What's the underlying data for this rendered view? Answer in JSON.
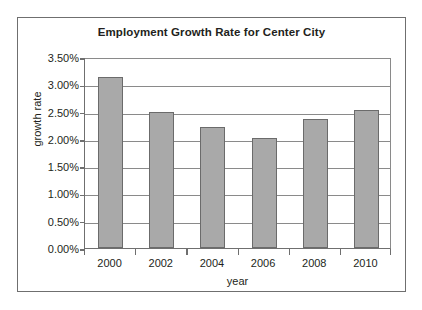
{
  "chart_data": {
    "type": "bar",
    "title": "Employment Growth Rate for Center City",
    "xlabel": "year",
    "ylabel": "growth rate",
    "categories": [
      "2000",
      "2002",
      "2004",
      "2006",
      "2008",
      "2010"
    ],
    "values": [
      3.13,
      2.5,
      2.21,
      2.02,
      2.36,
      2.53
    ],
    "value_unit": "%",
    "ylim": [
      0.0,
      3.5
    ],
    "ytick_values": [
      0.0,
      0.5,
      1.0,
      1.5,
      2.0,
      2.5,
      3.0,
      3.5
    ],
    "ytick_labels": [
      "0.00%",
      "0.50%",
      "1.00%",
      "1.50%",
      "2.00%",
      "2.50%",
      "3.00%",
      "3.50%"
    ],
    "grid": "horizontal",
    "legend": "none",
    "series": [
      {
        "name": "growth rate",
        "values": [
          3.13,
          2.5,
          2.21,
          2.02,
          2.36,
          2.53
        ]
      }
    ],
    "colors": {
      "bar_fill": "#a9a9a9",
      "bar_stroke": "#6b6b6b",
      "gridline": "#8a8a8a",
      "axis": "#6f6f6f",
      "text": "#231f20",
      "plot_background": "#ffffff",
      "frame_border": "#6f6f6f"
    }
  }
}
